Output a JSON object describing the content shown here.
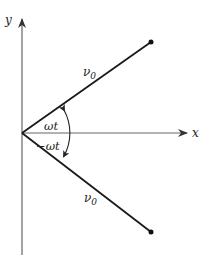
{
  "diagram": {
    "axes": {
      "x_label": "x",
      "y_label": "y"
    },
    "vectors": [
      {
        "label": "ν",
        "subscript": "0",
        "direction": "upper"
      },
      {
        "label": "ν",
        "subscript": "0",
        "direction": "lower"
      }
    ],
    "angles": {
      "upper": "ωt",
      "lower": "−ωt"
    },
    "colors": {
      "line": "#1a1a1a",
      "axis": "#555555",
      "background": "#ffffff"
    }
  }
}
